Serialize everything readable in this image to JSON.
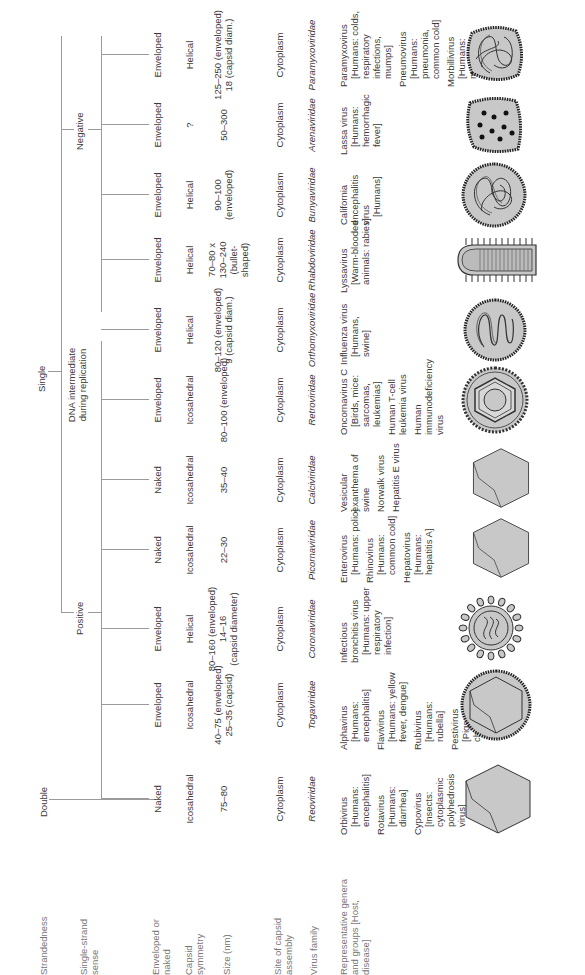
{
  "row_labels": {
    "strandedness": "Strandedness",
    "single_strand_sense": "Single-strand sense",
    "enveloped_or_naked": "Enveloped or naked",
    "capsid_symmetry": "Capsid symmetry",
    "size": "Size (nm)",
    "site_of_assembly": "Site of capsid assembly",
    "virus_family": "Virus family",
    "representative": "Representative genera and groups [Host, disease]"
  },
  "tree": {
    "double": "Double",
    "single": "Single",
    "positive": "Positive",
    "negative": "Negative",
    "dna_intermediate": "DNA intermediate during replication"
  },
  "families": [
    {
      "envelope": "Naked",
      "symmetry": "Icosahedral",
      "size": [
        "75–80"
      ],
      "site": "Cytoplasm",
      "family": "Reoviridae",
      "genera": [
        {
          "name": "Orbivirus",
          "host": "[Humans: encephalitis]"
        },
        {
          "name": "Rotavirus",
          "host": "[Humans: diarrhea]"
        },
        {
          "name": "Cypovirus",
          "host": "[Insects: cytoplasmic polyhedrosis virus]"
        }
      ],
      "shape": "icosahedron"
    },
    {
      "envelope": "Enveloped",
      "symmetry": "Icosahedral",
      "size": [
        "40–75 (enveloped)",
        "25–35 (capsid)"
      ],
      "site": "Cytoplasm",
      "family": "Togaviridae",
      "genera": [
        {
          "name": "Alphavirus",
          "host": "[Humans: encephalitis]"
        },
        {
          "name": "Flavivirus",
          "host": "[Humans: yellow fever, dengue]"
        },
        {
          "name": "Rubivirus",
          "host": "[Humans: rubella]"
        },
        {
          "name": "Pestivirus",
          "host": "[Pigs: hog cholera]"
        }
      ],
      "shape": "enveloped-icosahedron"
    },
    {
      "envelope": "Enveloped",
      "symmetry": "Helical",
      "size": [
        "80–160 (enveloped)",
        "14–16",
        "(capsid diameter)"
      ],
      "site": "Cytoplasm",
      "family": "Coronaviridae",
      "genera": [
        {
          "name": "Infectious bronchitis virus",
          "host": "[Humans: upper respiratory infection]"
        }
      ],
      "shape": "corona"
    },
    {
      "envelope": "Naked",
      "symmetry": "Icosahedral",
      "size": [
        "22–30"
      ],
      "site": "Cytoplasm",
      "family": "Picornaviridae",
      "genera": [
        {
          "name": "Enterovirus",
          "host": "[Humans: polio]"
        },
        {
          "name": "Rhinovirus",
          "host": "[Humans: common cold]"
        },
        {
          "name": "Hepatovirus",
          "host": "[Humans: hepatitis A]"
        }
      ],
      "shape": "icosahedron"
    },
    {
      "envelope": "Naked",
      "symmetry": "Icosahedral",
      "size": [
        "35–40"
      ],
      "site": "Cytoplasm",
      "family": "Calciviridae",
      "genera": [
        {
          "name": "Vesicular exanthema of swine",
          "host": ""
        },
        {
          "name": "Norwalk virus",
          "host": ""
        },
        {
          "name": "Hepatitis E virus",
          "host": ""
        }
      ],
      "shape": "icosahedron"
    },
    {
      "envelope": "Enveloped",
      "symmetry": "Icosahedral",
      "size": [
        "80–100 (enveloped)"
      ],
      "site": "Cytoplasm",
      "family": "Retroviridae",
      "genera": [
        {
          "name": "Oncornavirus C",
          "host": "[Birds, mice: sarcomas, leukemias]"
        },
        {
          "name": "Human T-cell leukemia virus",
          "host": ""
        },
        {
          "name": "Human immunodeficiency virus",
          "host": ""
        }
      ],
      "shape": "retro"
    },
    {
      "envelope": "Enveloped",
      "symmetry": "Helical",
      "size": [
        "80–120 (enveloped)",
        "9 (capsid diam.)"
      ],
      "site": "Cytoplasm",
      "family": "Orthomyxoviridae",
      "genera": [
        {
          "name": "Influenza virus",
          "host": "[Humans, swine]"
        }
      ],
      "shape": "coiled"
    },
    {
      "envelope": "Enveloped",
      "symmetry": "Helical",
      "size": [
        "70–80 x",
        "130–240",
        "(bullet-",
        "shaped)"
      ],
      "site": "Cytoplasm",
      "family": "Rhabdoviridae",
      "genera": [
        {
          "name": "Lyssavirus",
          "host": "[Warm-blooded animals: rabies]"
        }
      ],
      "shape": "bullet"
    },
    {
      "envelope": "Enveloped",
      "symmetry": "Helical",
      "size": [
        "90–100",
        "(enveloped)"
      ],
      "site": "Cytoplasm",
      "family": "Bunyaviridae",
      "genera": [
        {
          "name": "California encephalitis virus",
          "host": "[Humans]"
        }
      ],
      "shape": "tangle"
    },
    {
      "envelope": "Enveloped",
      "symmetry": "?",
      "size": [
        "50–300"
      ],
      "site": "Cytoplasm",
      "family": "Arenaviridae",
      "genera": [
        {
          "name": "Lassa virus",
          "host": "[Humans: hemorrhagic fever]"
        }
      ],
      "shape": "dots"
    },
    {
      "envelope": "Enveloped",
      "symmetry": "Helical",
      "size": [
        "125–250 (enveloped)",
        "18 (capsid diam.)"
      ],
      "site": "Cytoplasm",
      "family": "Paramyxoviridae",
      "genera": [
        {
          "name": "Paramyxovirus",
          "host": "[Humans: colds, respiratory infections, mumps]"
        },
        {
          "name": "Pneumovirus",
          "host": "[Humans: pneumonia, common cold]"
        },
        {
          "name": "Morbillivirus",
          "host": "[Humans: measles]"
        }
      ],
      "shape": "tangle2"
    }
  ],
  "colors": {
    "line": "#9a9a9a",
    "text": "#3a3a3a",
    "label": "#777777",
    "fill": "#c8c8c8",
    "stroke": "#333333"
  }
}
